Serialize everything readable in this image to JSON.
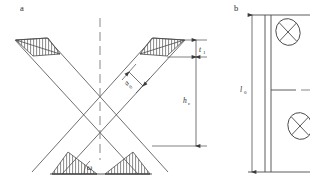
{
  "figure": {
    "panels": [
      {
        "id": "a",
        "label": "a",
        "caption_position": "top-left"
      },
      {
        "id": "b",
        "label": "b",
        "caption_position": "top-left"
      }
    ]
  },
  "panel_a": {
    "label": "a",
    "description": "cross-braced diagonal members forming an X with hatched end zones",
    "annotations": {
      "thickness": {
        "symbol": "t",
        "subscript": "1",
        "text": "t"
      },
      "member_width": {
        "symbol": "a",
        "subscript": "0",
        "text": "a"
      },
      "height": {
        "symbol": "h",
        "subscript": "c",
        "text": "h"
      },
      "angle": {
        "symbol": "ω",
        "text": "ω"
      }
    },
    "centerline": "dashed-vertical"
  },
  "panel_b": {
    "label": "b",
    "description": "elevation view with vertical column, dimension line and two circled-cross node markers",
    "annotations": {
      "length": {
        "symbol": "l",
        "subscript": "0",
        "text": "l"
      }
    },
    "nodes": [
      {
        "name": "node-marker-upper",
        "symbol": "circled-cross"
      },
      {
        "name": "node-marker-lower",
        "symbol": "circled-cross"
      }
    ]
  },
  "colors": {
    "line": "#4a4a4a",
    "line_dark": "#2f2f2f",
    "hatch": "#555555",
    "background": "#ffffff"
  }
}
